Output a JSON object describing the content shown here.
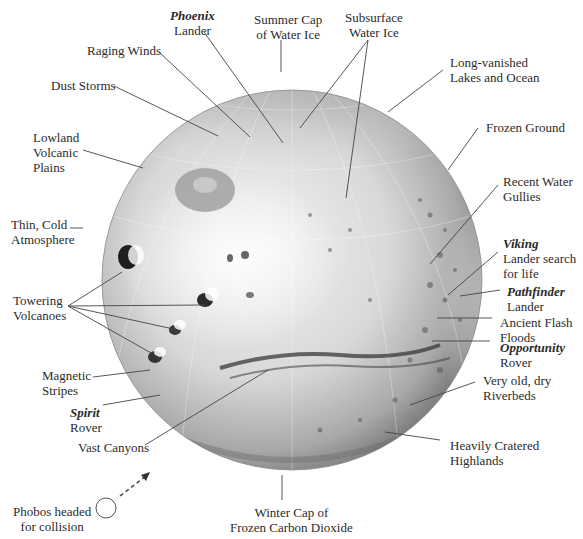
{
  "diagram": {
    "colors": {
      "background": "#ffffff",
      "globe_light": "#f2f2f2",
      "globe_mid": "#bdbdbd",
      "globe_dark": "#6e6e6e",
      "leader_line": "#444444",
      "text": "#2b2b2b"
    },
    "labels": {
      "phoenix": {
        "title": "Phoenix",
        "line1": "Lander"
      },
      "summer_cap": {
        "line1": "Summer Cap",
        "line2": "of Water Ice"
      },
      "subsurface_ice": {
        "line1": "Subsurface",
        "line2": "Water Ice"
      },
      "raging_winds": {
        "line1": "Raging Winds"
      },
      "long_vanished": {
        "line1": "Long-vanished",
        "line2": "Lakes and Ocean"
      },
      "dust_storms": {
        "line1": "Dust Storms"
      },
      "frozen_ground": {
        "line1": "Frozen Ground"
      },
      "lowland": {
        "line1": "Lowland",
        "line2": "Volcanic",
        "line3": "Plains"
      },
      "recent_gullies": {
        "line1": "Recent Water",
        "line2": "Gullies"
      },
      "thin_atmosphere": {
        "line1": "Thin, Cold",
        "line2": "Atmosphere"
      },
      "viking": {
        "title": "Viking",
        "line1": "Lander search",
        "line2": "for life"
      },
      "towering_volcanoes": {
        "line1": "Towering",
        "line2": "Volcanoes"
      },
      "pathfinder": {
        "title": "Pathfinder",
        "line1": "Lander"
      },
      "flash_floods": {
        "line1": "Ancient Flash",
        "line2": "Floods"
      },
      "opportunity": {
        "title": "Opportunity",
        "line1": "Rover"
      },
      "magnetic_stripes": {
        "line1": "Magnetic",
        "line2": "Stripes"
      },
      "riverbeds": {
        "line1": "Very old, dry",
        "line2": "Riverbeds"
      },
      "spirit": {
        "title": "Spirit",
        "line1": "Rover"
      },
      "vast_canyons": {
        "line1": "Vast Canyons"
      },
      "cratered_highlands": {
        "line1": "Heavily Cratered",
        "line2": "Highlands"
      },
      "phobos": {
        "line1": "Phobos headed",
        "line2": "for collision"
      },
      "winter_cap": {
        "line1": "Winter Cap of",
        "line2": "Frozen Carbon Dioxide"
      }
    },
    "icons": {
      "phobos": "circle-outline",
      "phobos_trajectory": "dashed-arrow"
    }
  }
}
